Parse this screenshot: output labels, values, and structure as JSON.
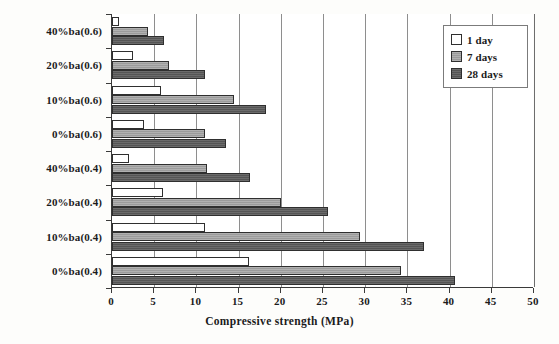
{
  "chart_data": {
    "type": "bar",
    "orientation": "horizontal",
    "title": "",
    "xlabel": "Compressive strength (MPa)",
    "ylabel": "",
    "xlim": [
      0,
      50
    ],
    "xticks": [
      "0",
      "5",
      "10",
      "15",
      "20",
      "25",
      "30",
      "35",
      "40",
      "45",
      "50"
    ],
    "grid": true,
    "grid_axis": "x",
    "legend_position": "top-right inside plot",
    "categories": [
      "40%ba(0.6)",
      "20%ba(0.6)",
      "10%ba(0.6)",
      "0%ba(0.6)",
      "40%ba(0.4)",
      "20%ba(0.4)",
      "10%ba(0.4)",
      "0%ba(0.4)"
    ],
    "series": [
      {
        "name": "1 day",
        "color": "#ffffff",
        "values": [
          0.8,
          2.5,
          5.8,
          3.8,
          2.0,
          6.1,
          11.0,
          16.2
        ]
      },
      {
        "name": "7 days",
        "color": "#9b9b9b",
        "values": [
          4.3,
          6.7,
          14.5,
          11.0,
          11.3,
          20.0,
          29.4,
          34.3
        ]
      },
      {
        "name": "28 days",
        "color": "#555555",
        "values": [
          6.2,
          11.0,
          18.2,
          13.5,
          16.4,
          25.6,
          37.0,
          40.6
        ]
      }
    ]
  },
  "legend": {
    "items": [
      {
        "label": "1 day"
      },
      {
        "label": "7 days"
      },
      {
        "label": "28 days"
      }
    ]
  },
  "axis": {
    "x_title": "Compressive strength (MPa)"
  }
}
